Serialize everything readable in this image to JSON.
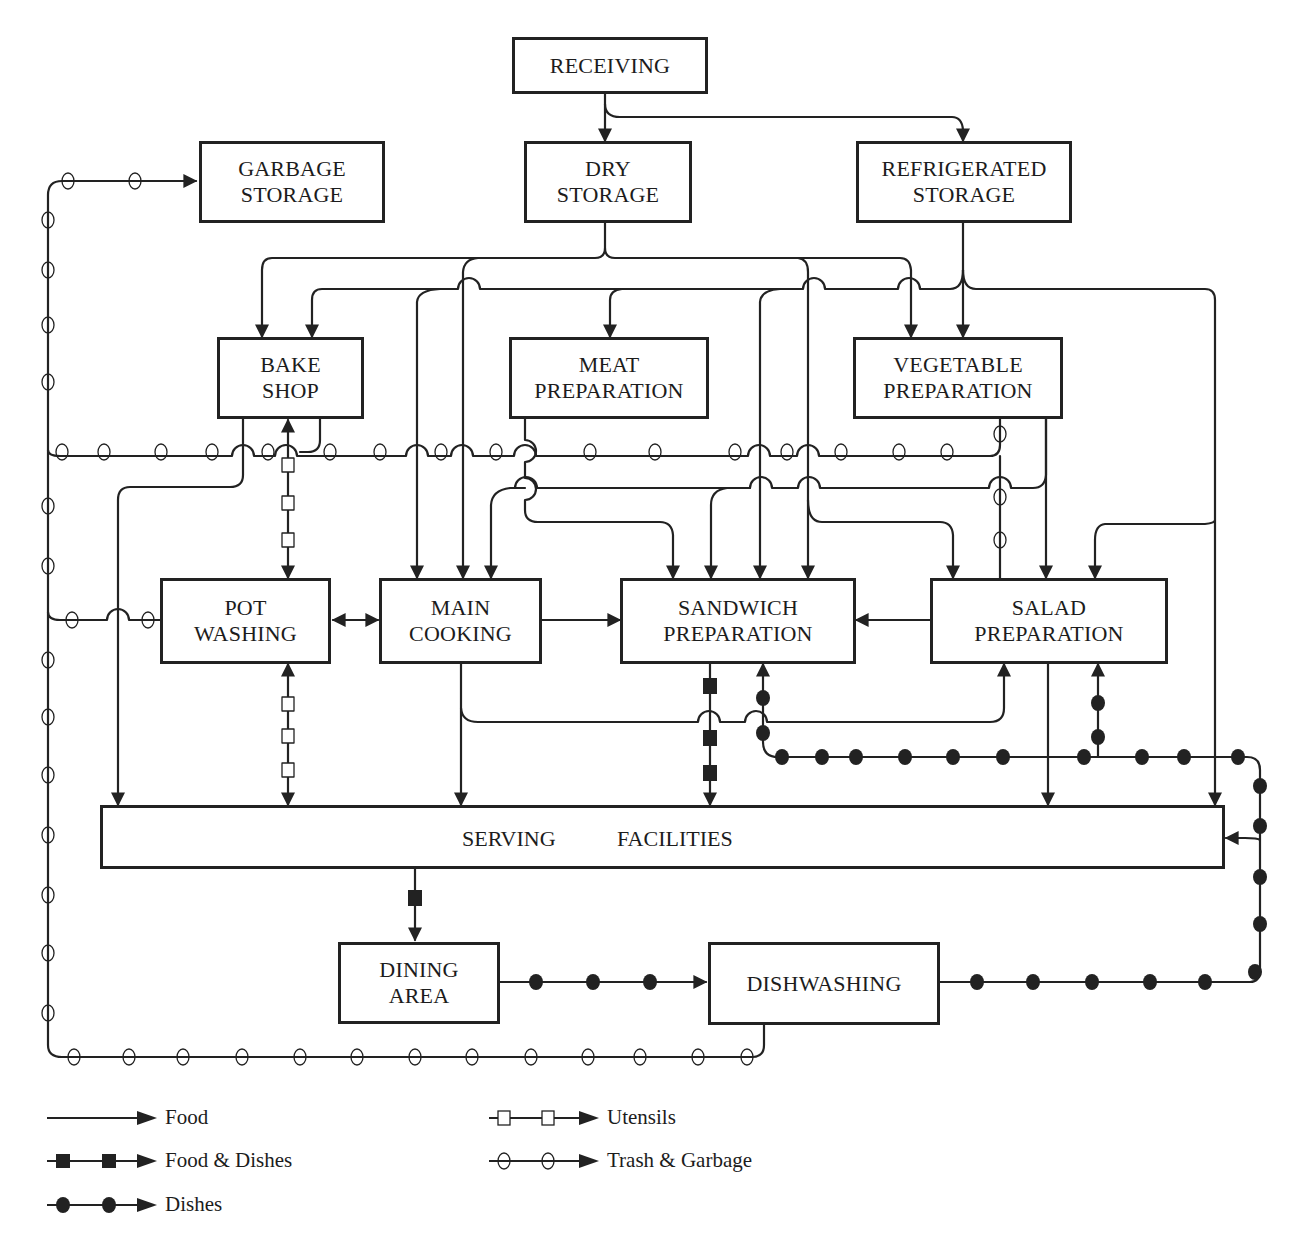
{
  "diagram": {
    "type": "flow",
    "title": "",
    "nodes": {
      "receiving": {
        "lines": [
          "RECEIVING"
        ]
      },
      "garbage_storage": {
        "lines": [
          "GARBAGE",
          "STORAGE"
        ]
      },
      "dry_storage": {
        "lines": [
          "DRY",
          "STORAGE"
        ]
      },
      "refrigerated_storage": {
        "lines": [
          "REFRIGERATED",
          "STORAGE"
        ]
      },
      "bake_shop": {
        "lines": [
          "BAKE",
          "SHOP"
        ]
      },
      "meat_preparation": {
        "lines": [
          "MEAT",
          "PREPARATION"
        ]
      },
      "vegetable_preparation": {
        "lines": [
          "VEGETABLE",
          "PREPARATION"
        ]
      },
      "pot_washing": {
        "lines": [
          "POT",
          "WASHING"
        ]
      },
      "main_cooking": {
        "lines": [
          "MAIN",
          "COOKING"
        ]
      },
      "sandwich_preparation": {
        "lines": [
          "SANDWICH",
          "PREPARATION"
        ]
      },
      "salad_preparation": {
        "lines": [
          "SALAD",
          "PREPARATION"
        ]
      },
      "serving_facilities": {
        "words": [
          "SERVING",
          "FACILITIES"
        ]
      },
      "dining_area": {
        "lines": [
          "DINING",
          "AREA"
        ]
      },
      "dishwashing": {
        "lines": [
          "DISHWASHING"
        ]
      }
    },
    "edges": [
      {
        "from": "Receiving",
        "to": "Dry Storage",
        "type": "food"
      },
      {
        "from": "Receiving",
        "to": "Refrigerated Storage",
        "type": "food"
      },
      {
        "from": "Dry Storage",
        "to": "Bake Shop",
        "type": "food"
      },
      {
        "from": "Dry Storage",
        "to": "Main Cooking",
        "type": "food"
      },
      {
        "from": "Dry Storage",
        "to": "Sandwich Preparation",
        "type": "food"
      },
      {
        "from": "Dry Storage",
        "to": "Vegetable Preparation",
        "type": "food"
      },
      {
        "from": "Refrigerated Storage",
        "to": "Bake Shop",
        "type": "food"
      },
      {
        "from": "Refrigerated Storage",
        "to": "Main Cooking",
        "type": "food"
      },
      {
        "from": "Refrigerated Storage",
        "to": "Meat Preparation",
        "type": "food"
      },
      {
        "from": "Refrigerated Storage",
        "to": "Sandwich Preparation",
        "type": "food"
      },
      {
        "from": "Refrigerated Storage",
        "to": "Vegetable Preparation",
        "type": "food"
      },
      {
        "from": "Refrigerated Storage",
        "to": "Salad Preparation",
        "type": "food"
      },
      {
        "from": "Refrigerated Storage",
        "to": "Serving Facilities",
        "type": "food"
      },
      {
        "from": "Bake Shop",
        "to": "Serving Facilities",
        "type": "food"
      },
      {
        "from": "Bake Shop",
        "to": "Pot Washing",
        "type": "utensils",
        "bidirectional": true
      },
      {
        "from": "Meat Preparation",
        "to": "Main Cooking",
        "type": "food"
      },
      {
        "from": "Meat Preparation",
        "to": "Sandwich Preparation",
        "type": "food"
      },
      {
        "from": "Meat Preparation",
        "to": "Salad Preparation",
        "type": "food"
      },
      {
        "from": "Vegetable Preparation",
        "to": "Main Cooking",
        "type": "food"
      },
      {
        "from": "Vegetable Preparation",
        "to": "Sandwich Preparation",
        "type": "food"
      },
      {
        "from": "Vegetable Preparation",
        "to": "Salad Preparation",
        "type": "food"
      },
      {
        "from": "Pot Washing",
        "to": "Main Cooking",
        "type": "food",
        "bidirectional": true
      },
      {
        "from": "Pot Washing",
        "to": "Serving Facilities",
        "type": "utensils",
        "bidirectional": true
      },
      {
        "from": "Main Cooking",
        "to": "Sandwich Preparation",
        "type": "food"
      },
      {
        "from": "Main Cooking",
        "to": "Salad Preparation",
        "type": "food"
      },
      {
        "from": "Main Cooking",
        "to": "Serving Facilities",
        "type": "food"
      },
      {
        "from": "Salad Preparation",
        "to": "Sandwich Preparation",
        "type": "food"
      },
      {
        "from": "Salad Preparation",
        "to": "Serving Facilities",
        "type": "food"
      },
      {
        "from": "Sandwich Preparation",
        "to": "Serving Facilities",
        "type": "food_and_dishes"
      },
      {
        "from": "Serving Facilities",
        "to": "Dining Area",
        "type": "food_and_dishes"
      },
      {
        "from": "Dining Area",
        "to": "Dishwashing",
        "type": "dishes"
      },
      {
        "from": "Dishwashing",
        "to": "Serving Facilities",
        "type": "dishes"
      },
      {
        "from": "Dishwashing",
        "to": "Sandwich Preparation",
        "type": "dishes"
      },
      {
        "from": "Dishwashing",
        "to": "Salad Preparation",
        "type": "dishes"
      },
      {
        "from": "Bake Shop",
        "to": "Garbage Storage",
        "type": "trash"
      },
      {
        "from": "Meat Preparation",
        "to": "Garbage Storage",
        "type": "trash"
      },
      {
        "from": "Vegetable Preparation",
        "to": "Garbage Storage",
        "type": "trash"
      },
      {
        "from": "Salad Preparation",
        "to": "Garbage Storage",
        "type": "trash"
      },
      {
        "from": "Pot Washing",
        "to": "Garbage Storage",
        "type": "trash"
      },
      {
        "from": "Dishwashing",
        "to": "Garbage Storage",
        "type": "trash"
      }
    ]
  },
  "legend": {
    "items": [
      {
        "key": "food",
        "label": "Food"
      },
      {
        "key": "food_and_dishes",
        "label": "Food & Dishes"
      },
      {
        "key": "dishes",
        "label": "Dishes"
      },
      {
        "key": "utensils",
        "label": "Utensils"
      },
      {
        "key": "trash",
        "label": "Trash & Garbage"
      }
    ]
  },
  "colors": {
    "ink": "#222222",
    "background": "#ffffff"
  }
}
